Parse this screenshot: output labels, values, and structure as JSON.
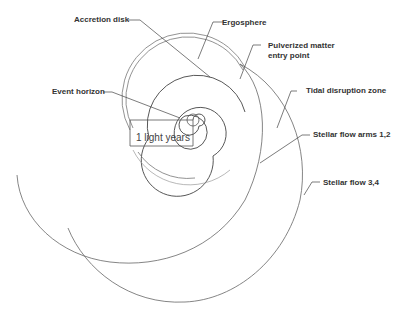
{
  "diagram": {
    "labels": {
      "accretion_disk": "Accretion disk",
      "ergosphere": "Ergosphere",
      "pulverized_matter": "Pulverized matter",
      "entry_point": "entry point",
      "event_horizon": "Event horizon",
      "tidal_disruption": "Tidal disruption zone",
      "stellar_flow_12": "Stellar flow arms 1,2",
      "stellar_flow_34": "Stellar flow 3,4"
    },
    "scale_bar": {
      "label": "1 light years"
    },
    "colors": {
      "line": "#555555",
      "light_line": "#888888",
      "text": "#333333",
      "background": "#ffffff"
    }
  }
}
